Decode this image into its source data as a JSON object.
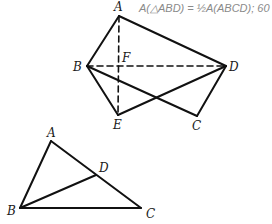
{
  "annotation": {
    "text": "A(△ABD) = ½A(ABCD); 60",
    "color": "#8a8a8a"
  },
  "figure1": {
    "points": {
      "A": {
        "label": "A",
        "x": 119,
        "y": 16
      },
      "B": {
        "label": "B",
        "x": 87,
        "y": 66
      },
      "D": {
        "label": "D",
        "x": 226,
        "y": 66
      },
      "F": {
        "label": "F",
        "x": 119,
        "y": 66
      },
      "E": {
        "label": "E",
        "x": 118,
        "y": 115
      },
      "C": {
        "label": "C",
        "x": 197,
        "y": 116
      }
    },
    "solid_segments": [
      "AB",
      "AD",
      "BE",
      "BC",
      "ED",
      "CD"
    ],
    "dashed_segments": [
      "BD",
      "AE"
    ]
  },
  "figure2": {
    "points": {
      "A": {
        "label": "A",
        "x": 51,
        "y": 141
      },
      "B": {
        "label": "B",
        "x": 20,
        "y": 208
      },
      "C": {
        "label": "C",
        "x": 141,
        "y": 208
      },
      "D": {
        "label": "D",
        "x": 96,
        "y": 175
      }
    },
    "solid_segments": [
      "AB",
      "AC",
      "BC",
      "BD"
    ]
  },
  "line_color": "#111111"
}
